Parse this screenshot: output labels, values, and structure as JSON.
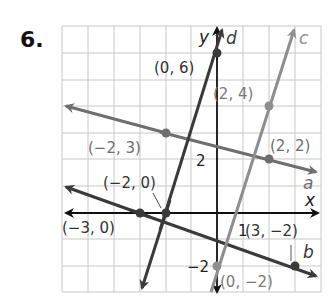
{
  "problem": {
    "number": "6."
  },
  "colors": {
    "grid": "#c8c8c8",
    "axis": "#111111",
    "line_dark": "#3a3a3a",
    "line_a": "#6e6e6e",
    "line_c": "#8e8e8e",
    "label_dark": "#333333",
    "label_gray": "#7a7a7a"
  },
  "axes": {
    "x_label": "x",
    "y_label": "y",
    "x_range": [
      -6,
      4
    ],
    "y_range": [
      -3,
      7
    ],
    "tick_labels": {
      "x_1": "1",
      "y_2": "2",
      "y_neg2": "−2"
    }
  },
  "lines": [
    {
      "name": "a",
      "points": [
        "(−2, 3)",
        "(2, 2)"
      ]
    },
    {
      "name": "b",
      "points": [
        "(−3, 0)",
        "(3, −2)"
      ]
    },
    {
      "name": "c",
      "points": [
        "(0, −2)",
        "(2, 4)"
      ]
    },
    {
      "name": "d",
      "points": [
        "(−2, 0)",
        "(0, 6)"
      ]
    }
  ],
  "point_labels": {
    "p_0_6": "(0, 6)",
    "p_2_4": "(2, 4)",
    "p_n2_3": "(−2, 3)",
    "p_2_2": "(2, 2)",
    "p_n2_0": "(−2, 0)",
    "p_n3_0": "(−3, 0)",
    "p_3_n2": "(3, −2)",
    "p_0_n2": "(0, −2)"
  },
  "line_labels": {
    "a": "a",
    "b": "b",
    "c": "c",
    "d": "d"
  }
}
